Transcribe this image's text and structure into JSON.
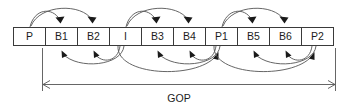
{
  "diagram": {
    "colors": {
      "background": "#ffffff",
      "box_stroke": "#3a3a3a",
      "box_fill": "#ffffff",
      "arc_stroke": "#555555",
      "arrow_head": "#1a1a1a",
      "text": "#1c1c1c"
    },
    "frames": [
      {
        "label": "P",
        "index": 0
      },
      {
        "label": "B1",
        "index": 1
      },
      {
        "label": "B2",
        "index": 2
      },
      {
        "label": "I",
        "index": 3
      },
      {
        "label": "B3",
        "index": 4
      },
      {
        "label": "B4",
        "index": 5
      },
      {
        "label": "P1",
        "index": 6
      },
      {
        "label": "B5",
        "index": 7
      },
      {
        "label": "B6",
        "index": 8
      },
      {
        "label": "P2",
        "index": 9
      }
    ],
    "forward_predictions": [
      {
        "from": "P",
        "to": "B1"
      },
      {
        "from": "P",
        "to": "B2"
      },
      {
        "from": "I",
        "to": "B3"
      },
      {
        "from": "I",
        "to": "B4"
      },
      {
        "from": "P1",
        "to": "B5"
      },
      {
        "from": "P1",
        "to": "B6"
      }
    ],
    "backward_predictions": [
      {
        "from": "I",
        "to": "B1"
      },
      {
        "from": "I",
        "to": "B2"
      },
      {
        "from": "P1",
        "to": "B3"
      },
      {
        "from": "P1",
        "to": "B4"
      },
      {
        "from": "P2",
        "to": "B5"
      },
      {
        "from": "P2",
        "to": "B6"
      },
      {
        "from": "I",
        "to": "P1"
      },
      {
        "from": "P1",
        "to": "P2"
      }
    ],
    "span": {
      "label": "GOP",
      "from_frame": "B1",
      "to_frame": "P2"
    }
  }
}
